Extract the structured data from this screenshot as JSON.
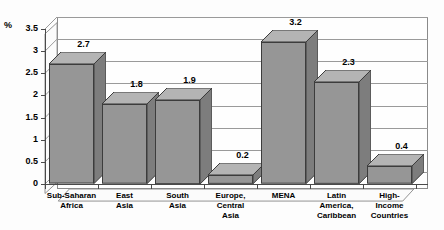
{
  "chart_data": {
    "type": "bar",
    "title": "",
    "subtitle": "",
    "xlabel": "",
    "ylabel": "%",
    "ylim": [
      0,
      3.5
    ],
    "ytick_values": [
      0,
      0.5,
      1,
      1.5,
      2,
      2.5,
      3,
      3.5
    ],
    "ytick_labels": [
      "0",
      "0.5",
      "1",
      "1.5",
      "2",
      "2.5",
      "3",
      "3.5"
    ],
    "grid": true,
    "legend": false,
    "legend_position": "none",
    "style": "3d-column",
    "categories": [
      "Sub-Saharan\nAfrica",
      "East\nAsia",
      "South\nAsia",
      "Europe,\nCentral\nAsia",
      "MENA",
      "Latin\nAmerica,\nCaribbean",
      "High-\nIncome\nCountries"
    ],
    "values": [
      2.7,
      1.8,
      1.9,
      0.2,
      3.2,
      2.3,
      0.4
    ],
    "value_labels": [
      "2.7",
      "1.8",
      "1.9",
      "0.2",
      "3.2",
      "2.3",
      "0.4"
    ],
    "colors": {
      "bar_front": "#969696",
      "bar_side": "#7d7d7d",
      "bar_top": "#b4b4b4",
      "bar_outline": "#3c3c3c",
      "gridline": "#9a9a9a",
      "axis": "#4a4a4a",
      "plot_background": "#fefefe",
      "page_background": "#fdfdfd",
      "text": "#000000"
    }
  }
}
